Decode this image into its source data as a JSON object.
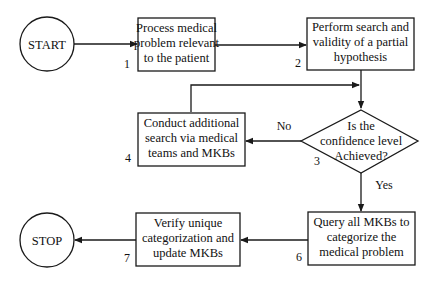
{
  "diagram": {
    "colors": {
      "line": "#1a1a1a",
      "background": "#ffffff",
      "text": "#111111"
    },
    "nodes": {
      "start": {
        "label": "START"
      },
      "stop": {
        "label": "STOP"
      },
      "step1": {
        "number": "1",
        "lines": [
          "Process medical",
          "problem relevant",
          "to the patient"
        ]
      },
      "step2": {
        "number": "2",
        "lines": [
          "Perform search and",
          "validity of a partial",
          "hypothesis"
        ]
      },
      "step3": {
        "number": "3",
        "lines": [
          "Is the",
          "confidence level",
          "Achieved?"
        ]
      },
      "step4": {
        "number": "4",
        "lines": [
          "Conduct additional",
          "search via medical",
          "teams and MKBs"
        ]
      },
      "step6": {
        "number": "6",
        "lines": [
          "Query all MKBs to",
          "categorize the",
          "medical problem"
        ]
      },
      "step7": {
        "number": "7",
        "lines": [
          "Verify unique",
          "categorization and",
          "update MKBs"
        ]
      }
    },
    "edge_labels": {
      "no": "No",
      "yes": "Yes"
    }
  }
}
